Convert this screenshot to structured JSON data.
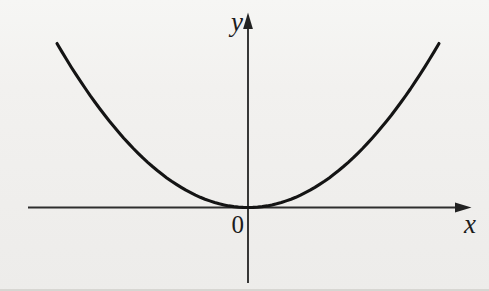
{
  "figure": {
    "background_color": "#f1f0ee",
    "curve_color": "#141414",
    "axis_color": "#2e2e2e"
  },
  "chart_data": {
    "type": "line",
    "title": "",
    "curve_name": "parabola y = x^2",
    "equation": {
      "a": 1,
      "b": 0,
      "c": 0
    },
    "x_range": [
      -2,
      2
    ],
    "y_range": [
      0,
      4
    ],
    "points": [
      [
        -2,
        4
      ],
      [
        -1.5,
        2.25
      ],
      [
        -1,
        1
      ],
      [
        -0.5,
        0.25
      ],
      [
        0,
        0
      ],
      [
        0.5,
        0.25
      ],
      [
        1,
        1
      ],
      [
        1.5,
        2.25
      ],
      [
        2,
        4
      ]
    ],
    "xlabel": "x",
    "ylabel": "y",
    "origin_label": "0",
    "grid": false,
    "legend": null,
    "axis_style": "arrowed, through origin",
    "tick_labels": []
  }
}
